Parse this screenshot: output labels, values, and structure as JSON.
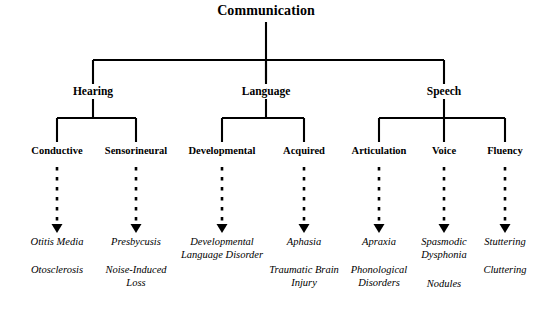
{
  "diagram": {
    "title": "Communication",
    "type": "hierarchy-tree",
    "background_color": "#ffffff",
    "line_color": "#000000",
    "root": {
      "label": "Communication",
      "x": 266,
      "y": 16
    },
    "branches": [
      {
        "label": "Hearing",
        "x": 93,
        "y": 94,
        "children": [
          {
            "label": "Conductive",
            "x": 57,
            "y": 152,
            "leaves": [
              "Otitis Media",
              "Otosclerosis"
            ]
          },
          {
            "label": "Sensorineural",
            "x": 136,
            "y": 152,
            "leaves": [
              "Presbycusis",
              "Noise-Induced Loss"
            ]
          }
        ]
      },
      {
        "label": "Language",
        "x": 266,
        "y": 94,
        "children": [
          {
            "label": "Developmental",
            "x": 222,
            "y": 152,
            "leaves": [
              "Developmental Language Disorder",
              ""
            ]
          },
          {
            "label": "Acquired",
            "x": 304,
            "y": 152,
            "leaves": [
              "Aphasia",
              "Traumatic Brain Injury"
            ]
          }
        ]
      },
      {
        "label": "Speech",
        "x": 444,
        "y": 94,
        "children": [
          {
            "label": "Articulation",
            "x": 379,
            "y": 152,
            "leaves": [
              "Apraxia",
              "Phonological Disorders"
            ]
          },
          {
            "label": "Voice",
            "x": 444,
            "y": 152,
            "leaves": [
              "Spasmodic Dysphonia",
              "Nodules"
            ]
          },
          {
            "label": "Fluency",
            "x": 505,
            "y": 152,
            "leaves": [
              "Stuttering",
              "Cluttering"
            ]
          }
        ]
      }
    ]
  }
}
